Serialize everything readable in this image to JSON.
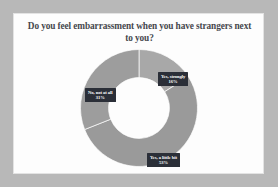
{
  "chart_data": {
    "type": "pie",
    "variant": "donut",
    "title": "Do you feel embarrassment when you have strangers next to you?",
    "xlabel": "",
    "ylabel": "",
    "legend": "none",
    "grid": false,
    "start_angle_deg": 0,
    "direction": "clockwise",
    "inner_radius_ratio": 0.52,
    "categories": [
      "Yes, strongly",
      "Yes, a little bit",
      "No, not at all"
    ],
    "values": [
      16,
      53,
      31
    ],
    "value_unit": "%",
    "slices": [
      {
        "label": "Yes, strongly",
        "value": 16,
        "value_label": "16%",
        "color": "#a8a8a8",
        "start_deg": 0,
        "end_deg": 57.6
      },
      {
        "label": "Yes, a little bit",
        "value": 53,
        "value_label": "53%",
        "color": "#9a9a9a",
        "start_deg": 57.6,
        "end_deg": 248.4
      },
      {
        "label": "No, not at all",
        "value": 31,
        "value_label": "31%",
        "color": "#9d9d9d",
        "start_deg": 248.4,
        "end_deg": 360
      }
    ]
  },
  "panel": {
    "background": "#fdfdfd",
    "border_color": "#e3e3e3",
    "outer_background": "#b8b8b8"
  },
  "labels": {
    "strongly": {
      "text": "Yes, strongly",
      "pct": "16%"
    },
    "little": {
      "text": "Yes, a little bit",
      "pct": "53%"
    },
    "notatall": {
      "text": "No, not at all",
      "pct": "31%"
    }
  }
}
